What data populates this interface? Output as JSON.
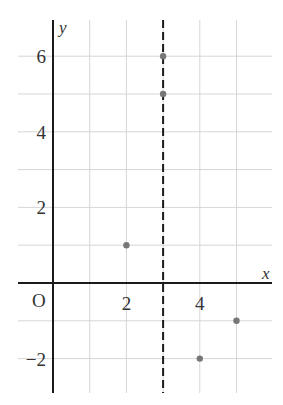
{
  "chart_data": {
    "type": "scatter",
    "title": "",
    "xlabel": "x",
    "ylabel": "y",
    "origin_label": "O",
    "xlim": [
      -1,
      6
    ],
    "ylim": [
      -3,
      6.7
    ],
    "grid": true,
    "x_tick_labels": [
      {
        "value": 2,
        "label": "2"
      },
      {
        "value": 4,
        "label": "4"
      }
    ],
    "y_tick_labels": [
      {
        "value": 6,
        "label": "6"
      },
      {
        "value": 4,
        "label": "4"
      },
      {
        "value": 2,
        "label": "2"
      },
      {
        "value": -2,
        "label": "−2"
      }
    ],
    "points": [
      {
        "x": 3,
        "y": 6
      },
      {
        "x": 3,
        "y": 5
      },
      {
        "x": 2,
        "y": 1
      },
      {
        "x": 5,
        "y": -1
      },
      {
        "x": 4,
        "y": -2
      }
    ],
    "vertical_line": {
      "x": 3,
      "style": "dashed"
    },
    "colors": {
      "grid": "#d6d6d6",
      "axis": "#1a1a1a",
      "point": "#777777",
      "text": "#333333"
    }
  }
}
